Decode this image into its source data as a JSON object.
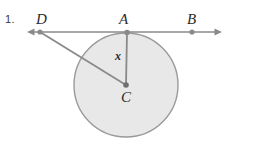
{
  "page": {
    "width": 253,
    "height": 145,
    "background_color": "#ffffff",
    "cut_off_top_text": "circle p"
  },
  "problem": {
    "number_label": "1."
  },
  "figure": {
    "type": "circle-with-tangent-and-secant",
    "stroke_color": "#8a8a8a",
    "circle_fill_color": "#e8e8e8",
    "circle_stroke_color": "#9a9a9a",
    "point_color": "#8a8a8a",
    "label_color": "#2b2b2b",
    "labels": {
      "D": "D",
      "A": "A",
      "B": "B",
      "C": "C",
      "x": "x"
    },
    "points": {
      "D": {
        "x": 40,
        "y": 32
      },
      "A": {
        "x": 127,
        "y": 33
      },
      "B": {
        "x": 192,
        "y": 32
      },
      "C": {
        "x": 126,
        "y": 85
      }
    },
    "circle": {
      "center_x": 126,
      "center_y": 85,
      "radius": 52
    },
    "line": {
      "name": "tangent-line-DAB",
      "x_start": 27,
      "x_end": 222,
      "y": 32,
      "arrow_left": true,
      "arrow_right": true
    },
    "segments": [
      {
        "name": "radius-AC",
        "from": "A",
        "to": "C",
        "label": "x"
      },
      {
        "name": "segment-DC",
        "from": "D",
        "to": "C",
        "label": ""
      }
    ]
  }
}
